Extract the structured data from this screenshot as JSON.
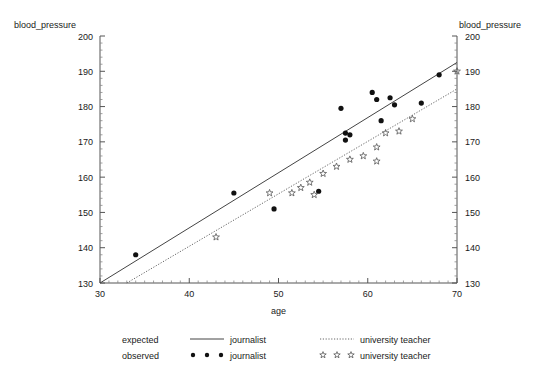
{
  "chart_data": {
    "type": "scatter",
    "title": "",
    "xlabel": "age",
    "ylabel": "blood_pressure",
    "ylabel_right": "blood_pressure",
    "xlim": [
      30,
      70
    ],
    "ylim": [
      130,
      200
    ],
    "xticks": [
      30,
      40,
      50,
      60,
      70
    ],
    "yticks": [
      130,
      140,
      150,
      160,
      170,
      180,
      190,
      200
    ],
    "xtick_labels": [
      "30",
      "40",
      "50",
      "60",
      "70"
    ],
    "ytick_labels": [
      "130",
      "140",
      "150",
      "160",
      "170",
      "180",
      "190",
      "200"
    ],
    "grid": false,
    "legend_position": "bottom",
    "series": [
      {
        "name": "journalist",
        "role": "observed",
        "marker": "filled-circle",
        "color": "#111111",
        "points": [
          [
            34,
            138
          ],
          [
            45,
            155.5
          ],
          [
            49.5,
            151
          ],
          [
            54.5,
            156
          ],
          [
            57,
            179.5
          ],
          [
            57.5,
            172.5
          ],
          [
            57.5,
            170.5
          ],
          [
            58,
            172
          ],
          [
            60.5,
            184
          ],
          [
            61,
            182
          ],
          [
            61.5,
            176
          ],
          [
            62.5,
            182.5
          ],
          [
            63,
            180.5
          ],
          [
            66,
            181
          ],
          [
            68,
            189
          ]
        ]
      },
      {
        "name": "university teacher",
        "role": "observed",
        "marker": "open-star",
        "color": "#555555",
        "points": [
          [
            43,
            143
          ],
          [
            49,
            155.5
          ],
          [
            51.5,
            155.5
          ],
          [
            52.5,
            157
          ],
          [
            53.5,
            158.5
          ],
          [
            54,
            155
          ],
          [
            55,
            161
          ],
          [
            56.5,
            163
          ],
          [
            58,
            165
          ],
          [
            59.5,
            166
          ],
          [
            61,
            168.5
          ],
          [
            61,
            164.5
          ],
          [
            62,
            172.5
          ],
          [
            63.5,
            173
          ],
          [
            65,
            176.5
          ],
          [
            70,
            190
          ]
        ]
      }
    ],
    "fit_lines": [
      {
        "name": "journalist",
        "role": "expected",
        "style": "solid",
        "color": "#444444",
        "x0": 30,
        "y0": 130,
        "x1": 70,
        "y1": 192.5
      },
      {
        "name": "university teacher",
        "role": "expected",
        "style": "dotted",
        "color": "#666666",
        "x0": 33,
        "y0": 130,
        "x1": 70,
        "y1": 185
      }
    ]
  },
  "legend": {
    "rows": [
      {
        "label": "expected",
        "entries": [
          {
            "marker": "solid-line",
            "name": "journalist"
          },
          {
            "marker": "dotted-line",
            "name": "university teacher"
          }
        ]
      },
      {
        "label": "observed",
        "entries": [
          {
            "marker": "filled-circle",
            "name": "journalist"
          },
          {
            "marker": "open-star",
            "name": "university teacher"
          }
        ]
      }
    ]
  },
  "colors": {
    "axis": "#555555",
    "text": "#1a1a1a",
    "journalist": "#111111",
    "university_teacher": "#555555",
    "background": "#ffffff"
  }
}
